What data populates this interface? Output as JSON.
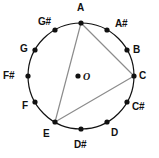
{
  "figure": {
    "center_label": "O",
    "colors": {
      "circle_stroke": "#111111",
      "point_fill": "#111111",
      "triangle_stroke": "#8c8c8c",
      "label_text": "#111111",
      "background": "#ffffff"
    },
    "geometry": {
      "center_x": 81,
      "center_y": 76,
      "radius": 53,
      "center_dot_x": 78,
      "center_dot_y": 76,
      "point_radius": 2.6
    },
    "notes": [
      {
        "name": "A",
        "angle_deg": 90,
        "px": 81,
        "py": 23,
        "label_x": 77,
        "label_y": 3,
        "dot": true
      },
      {
        "name": "A#",
        "angle_deg": 60,
        "px": 107,
        "py": 30,
        "label_x": 115,
        "label_y": 19,
        "dot": true
      },
      {
        "name": "B",
        "angle_deg": 30,
        "px": 127,
        "py": 50,
        "label_x": 133,
        "label_y": 45,
        "dot": true
      },
      {
        "name": "C",
        "angle_deg": 0,
        "px": 134,
        "py": 76,
        "label_x": 139,
        "label_y": 71,
        "dot": true
      },
      {
        "name": "C#",
        "angle_deg": 330,
        "px": 127,
        "py": 102,
        "label_x": 132,
        "label_y": 102,
        "dot": true
      },
      {
        "name": "D",
        "angle_deg": 300,
        "px": 107,
        "py": 122,
        "label_x": 111,
        "label_y": 128,
        "dot": true
      },
      {
        "name": "D#",
        "angle_deg": 270,
        "px": 81,
        "py": 129,
        "label_x": 74,
        "label_y": 140,
        "dot": true
      },
      {
        "name": "E",
        "angle_deg": 240,
        "px": 55,
        "py": 122,
        "label_x": 43,
        "label_y": 129,
        "dot": true
      },
      {
        "name": "F",
        "angle_deg": 210,
        "px": 35,
        "py": 102,
        "label_x": 22,
        "label_y": 101,
        "dot": true
      },
      {
        "name": "F#",
        "angle_deg": 180,
        "px": 28,
        "py": 76,
        "label_x": 3,
        "label_y": 71,
        "dot": true
      },
      {
        "name": "G",
        "angle_deg": 150,
        "px": 35,
        "py": 50,
        "label_x": 20,
        "label_y": 44,
        "dot": true
      },
      {
        "name": "G#",
        "angle_deg": 120,
        "px": 55,
        "py": 30,
        "label_x": 38,
        "label_y": 17,
        "dot": true
      }
    ],
    "triangle": {
      "vertices": [
        "A",
        "C",
        "E"
      ],
      "points": [
        {
          "name": "A",
          "x": 81,
          "y": 23
        },
        {
          "name": "C",
          "x": 134,
          "y": 76
        },
        {
          "name": "E",
          "x": 55,
          "y": 122
        }
      ]
    }
  }
}
